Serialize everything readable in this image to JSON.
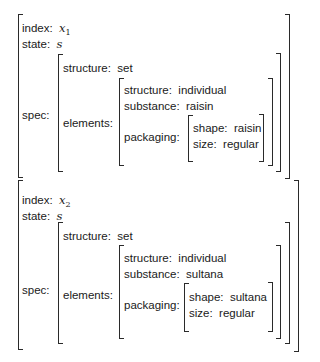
{
  "records": [
    {
      "index_label": "index:",
      "index_var": "x",
      "index_sub": "1",
      "state_label": "state:",
      "state_value": "s",
      "spec_label": "spec:",
      "spec": {
        "structure_label": "structure:",
        "structure_value": "set",
        "elements_label": "elements:",
        "elements": {
          "structure_label": "structure:",
          "structure_value": "individual",
          "substance_label": "substance:",
          "substance_value": "raisin",
          "packaging_label": "packaging:",
          "packaging": {
            "shape_label": "shape:",
            "shape_value": "raisin",
            "size_label": "size:",
            "size_value": "regular"
          }
        }
      }
    },
    {
      "index_label": "index:",
      "index_var": "x",
      "index_sub": "2",
      "state_label": "state:",
      "state_value": "s",
      "spec_label": "spec:",
      "spec": {
        "structure_label": "structure:",
        "structure_value": "set",
        "elements_label": "elements:",
        "elements": {
          "structure_label": "structure:",
          "structure_value": "individual",
          "substance_label": "substance:",
          "substance_value": "sultana",
          "packaging_label": "packaging:",
          "packaging": {
            "shape_label": "shape:",
            "shape_value": "sultana",
            "size_label": "size:",
            "size_value": "regular"
          }
        }
      }
    }
  ]
}
